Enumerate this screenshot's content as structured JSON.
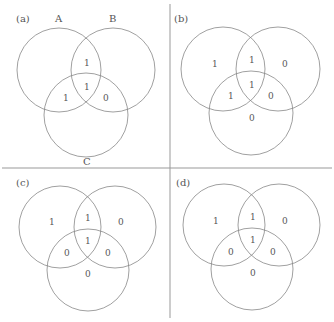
{
  "panels": [
    {
      "id": "a",
      "label": "(a)",
      "set_labels": [
        "A",
        "B",
        "C"
      ],
      "regions": {
        "A_only": "",
        "B_only": "",
        "C_only": "",
        "AB": "1",
        "AC": "1",
        "BC": "0",
        "ABC": "1"
      }
    },
    {
      "id": "b",
      "label": "(b)",
      "regions": {
        "A_only": "1",
        "B_only": "0",
        "C_only": "0",
        "AB": "1",
        "AC": "1",
        "BC": "0",
        "ABC": "1"
      }
    },
    {
      "id": "c",
      "label": "(c)",
      "regions": {
        "A_only": "1",
        "B_only": "0",
        "C_only": "0",
        "AB": "1",
        "AC": "0",
        "BC": "0",
        "ABC": "1"
      }
    },
    {
      "id": "d",
      "label": "(d)",
      "regions": {
        "A_only": "1",
        "B_only": "0",
        "C_only": "0",
        "AB": "1",
        "AC": "0",
        "BC": "0",
        "ABC": "1"
      }
    }
  ]
}
